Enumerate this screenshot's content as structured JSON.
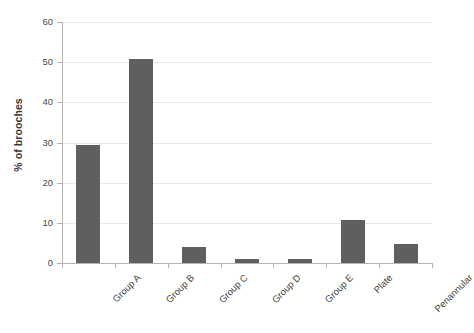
{
  "chart_data": {
    "type": "bar",
    "title": "",
    "subtitle": "",
    "xlabel": "",
    "ylabel": "% of brooches",
    "categories": [
      "Group A",
      "Group B",
      "Group C",
      "Group D",
      "Group E",
      "Plate",
      "Penannular"
    ],
    "values": [
      29.3,
      50.7,
      4.0,
      0.9,
      1.0,
      10.7,
      4.8
    ],
    "ylim": [
      0,
      60
    ],
    "ytick_labels": [
      "0",
      "10",
      "20",
      "30",
      "40",
      "50",
      "60"
    ],
    "ytick_values": [
      0,
      10,
      20,
      30,
      40,
      50,
      60
    ],
    "grid": true,
    "grid_axis": "y",
    "legend": false,
    "legend_position": "none",
    "series": [
      {
        "name": "% of brooches",
        "values": [
          29.3,
          50.7,
          4.0,
          0.9,
          1.0,
          10.7,
          4.8
        ]
      }
    ],
    "colors": {
      "bar": "#5f5f5f",
      "gridline": "#e8e8e8",
      "axis": "#b4b4b4",
      "text": "#3f3f3f",
      "background": "#ffffff"
    },
    "xtick_label_rotation": -45
  }
}
